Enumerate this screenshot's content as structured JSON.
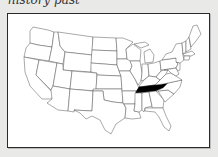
{
  "caption": "history past",
  "map": {
    "title": "United States",
    "highlighted_state": "Tennessee",
    "highlight_color": "#000000",
    "state_fill": "#ffffff",
    "border_color": "#555555"
  }
}
